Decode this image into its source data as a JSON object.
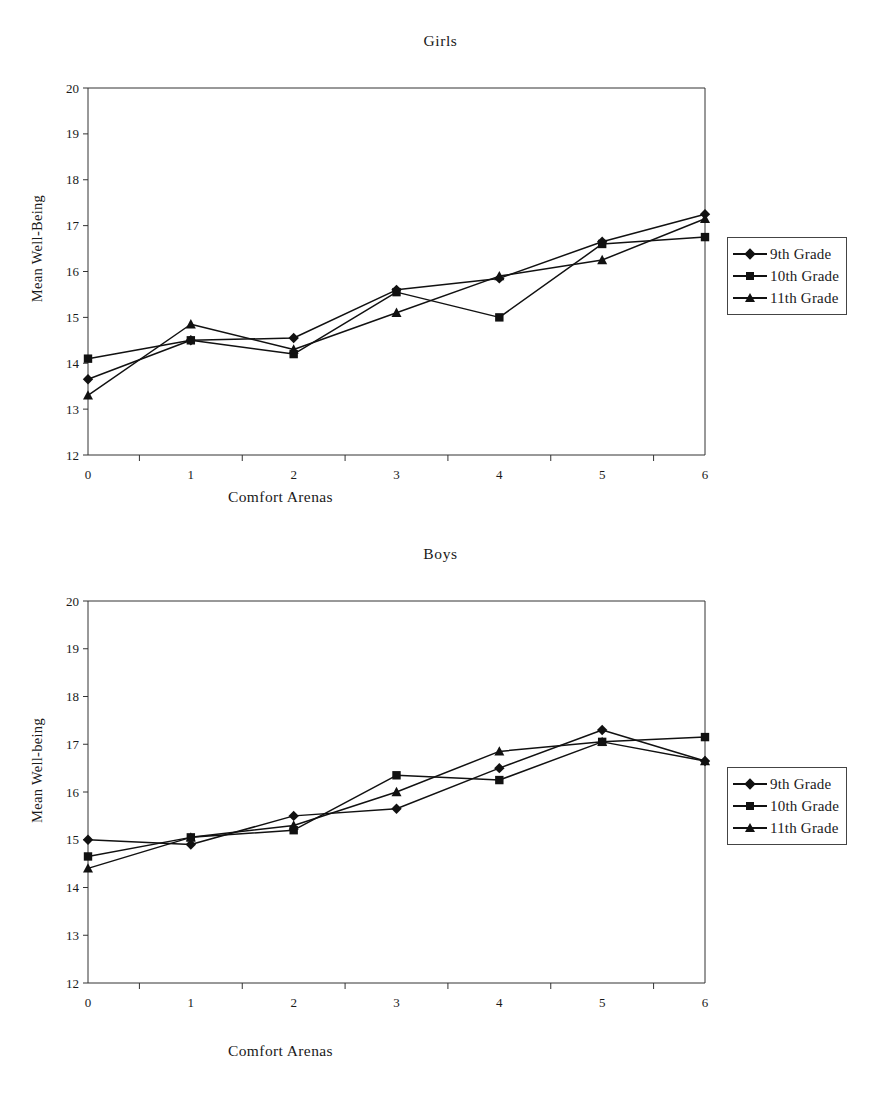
{
  "figure": {
    "panels": [
      "girls",
      "boys"
    ]
  },
  "girls": {
    "title": "Girls",
    "xlabel": "Comfort Arenas",
    "ylabel": "Mean Well-Being",
    "legend": {
      "items": [
        {
          "label": "9th Grade",
          "marker": "diamond"
        },
        {
          "label": "10th Grade",
          "marker": "square"
        },
        {
          "label": "11th Grade",
          "marker": "triangle"
        }
      ]
    }
  },
  "boys": {
    "title": "Boys",
    "xlabel": "Comfort Arenas",
    "ylabel": "Mean Well-being",
    "legend": {
      "items": [
        {
          "label": "9th Grade",
          "marker": "diamond"
        },
        {
          "label": "10th Grade",
          "marker": "square"
        },
        {
          "label": "11th Grade",
          "marker": "triangle"
        }
      ]
    }
  },
  "chart_data": [
    {
      "type": "line",
      "title": "Girls",
      "xlabel": "Comfort Arenas",
      "ylabel": "Mean Well-Being",
      "categories": [
        "0",
        "1",
        "2",
        "3",
        "4",
        "5",
        "6"
      ],
      "xlim": [
        0,
        6
      ],
      "ylim": [
        12,
        20
      ],
      "yticks": [
        12,
        13,
        14,
        15,
        16,
        17,
        18,
        19,
        20
      ],
      "grid": false,
      "legend_position": "right",
      "series": [
        {
          "name": "9th Grade",
          "marker": "diamond",
          "values": [
            13.65,
            14.5,
            14.55,
            15.6,
            15.85,
            16.65,
            17.25
          ]
        },
        {
          "name": "10th Grade",
          "marker": "square",
          "values": [
            14.1,
            14.5,
            14.2,
            15.55,
            15.0,
            16.6,
            16.75
          ]
        },
        {
          "name": "11th Grade",
          "marker": "triangle",
          "values": [
            13.3,
            14.85,
            14.3,
            15.1,
            15.9,
            16.25,
            17.15
          ]
        }
      ]
    },
    {
      "type": "line",
      "title": "Boys",
      "xlabel": "Comfort Arenas",
      "ylabel": "Mean Well-being",
      "categories": [
        "0",
        "1",
        "2",
        "3",
        "4",
        "5",
        "6"
      ],
      "xlim": [
        0,
        6
      ],
      "ylim": [
        12,
        20
      ],
      "yticks": [
        12,
        13,
        14,
        15,
        16,
        17,
        18,
        19,
        20
      ],
      "grid": false,
      "legend_position": "right",
      "series": [
        {
          "name": "9th Grade",
          "marker": "diamond",
          "values": [
            15.0,
            14.9,
            15.5,
            15.65,
            16.5,
            17.3,
            16.65
          ]
        },
        {
          "name": "10th Grade",
          "marker": "square",
          "values": [
            14.65,
            15.05,
            15.2,
            16.35,
            16.25,
            17.05,
            17.15
          ]
        },
        {
          "name": "11th Grade",
          "marker": "triangle",
          "values": [
            14.4,
            15.05,
            15.3,
            16.0,
            16.85,
            17.05,
            16.65
          ]
        }
      ]
    }
  ]
}
